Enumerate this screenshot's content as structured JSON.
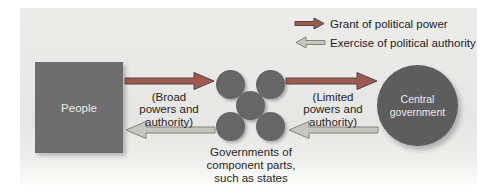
{
  "diagram": {
    "legend": {
      "grant": {
        "label": "Grant of political power",
        "color": "#9e5a4f"
      },
      "exercise": {
        "label": "Exercise of political authority",
        "color": "#c7c7bf"
      }
    },
    "people": {
      "label": "People",
      "color": "#6e6e6e"
    },
    "central": {
      "label_line1": "Central",
      "label_line2": "government",
      "color": "#5d5d5d"
    },
    "states": {
      "caption_line1": "Governments of",
      "caption_line2": "component parts,",
      "caption_line3": "such as states",
      "circle_color": "#666666",
      "circle_count": 5
    },
    "flows": {
      "broad": {
        "line1": "(Broad",
        "line2": "powers and",
        "line3": "authority)"
      },
      "limited": {
        "line1": "(Limited",
        "line2": "powers and",
        "line3": "authority)"
      }
    }
  }
}
